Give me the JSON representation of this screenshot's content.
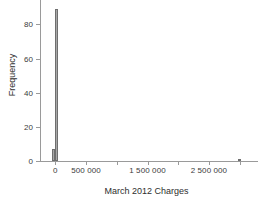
{
  "chart_data": {
    "type": "bar",
    "title": "",
    "subtitle": "",
    "xlabel": "March 2012 Charges",
    "ylabel": "Frequency",
    "xlim": [
      -250000,
      3250000
    ],
    "ylim": [
      0,
      92
    ],
    "grid": false,
    "legend": null,
    "bin_width": 50000,
    "categories": [
      "-50000",
      "0",
      "3000000"
    ],
    "x": [
      -25000,
      25000,
      3000000
    ],
    "values": [
      7,
      89,
      1
    ],
    "bars": [
      {
        "label": "bin-1",
        "x_center": -25000,
        "value": 7
      },
      {
        "label": "bin-2",
        "x_center": 25000,
        "value": 89
      },
      {
        "label": "bin-outlier",
        "x_center": 3000000,
        "value": 1
      }
    ],
    "xticks": [
      0,
      500000,
      1000000,
      1500000,
      2000000,
      2500000,
      3000000
    ],
    "xticklabels": [
      "0",
      "500 000",
      "",
      "1 500 000",
      "",
      "2 500 000",
      ""
    ],
    "yticks": [
      0,
      20,
      40,
      60,
      80
    ],
    "yticklabels": [
      "0",
      "20",
      "40",
      "60",
      "80"
    ],
    "colors": {
      "bar_fill": "#a8a8a8",
      "bar_edge": "#6f6f6f",
      "axis": "#9a9a9a",
      "text": "#2e2e2e",
      "background": "#ffffff"
    }
  },
  "axes": {
    "x_title": "March 2012 Charges",
    "y_title": "Frequency"
  }
}
